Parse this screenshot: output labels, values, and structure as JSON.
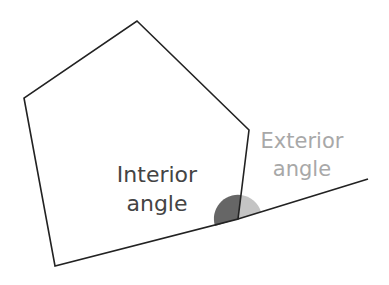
{
  "diagram": {
    "type": "pentagon-exterior-angle",
    "labels": {
      "interior_line1": "Interior",
      "interior_line2": "angle",
      "exterior_line1": "Exterior",
      "exterior_line2": "angle"
    },
    "colors": {
      "outline": "#222222",
      "interior_text": "#444444",
      "exterior_text": "#a8a8a8",
      "interior_fill": "#666666",
      "exterior_fill": "#c4c4c4",
      "background": "#ffffff"
    }
  }
}
